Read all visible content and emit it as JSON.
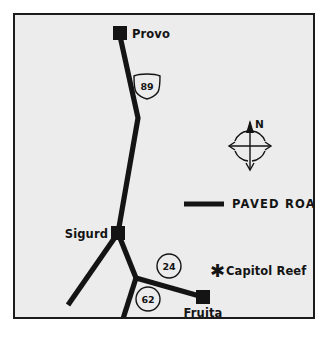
{
  "map": {
    "title": "Capitol Reef Area Road Map",
    "background_color": "#ececec",
    "frame_color": "#1b1b1b",
    "ink_color": "#141414",
    "cities": [
      {
        "name": "Provo",
        "marker": "filled-square",
        "x": 120,
        "y": 33,
        "label_x": 132,
        "label_y": 38
      },
      {
        "name": "Sigurd",
        "marker": "filled-square",
        "x": 118,
        "y": 233,
        "label_x": 111,
        "label_y": 238,
        "label_anchor": "end"
      },
      {
        "name": "Fruita",
        "marker": "filled-square",
        "x": 203,
        "y": 297,
        "label_x": 203,
        "label_y": 316,
        "label_anchor": "middle"
      }
    ],
    "parks": [
      {
        "name": "Capitol Reef",
        "marker": "star",
        "x": 216,
        "y": 270,
        "label_x": 226,
        "label_y": 275
      }
    ],
    "routes": [
      {
        "number": "89",
        "shield": "us-highway",
        "x": 147,
        "y": 86
      },
      {
        "number": "24",
        "shield": "state-circle",
        "x": 169,
        "y": 269
      },
      {
        "number": "62",
        "shield": "state-circle",
        "x": 148,
        "y": 301
      }
    ],
    "legend": {
      "label": "PAVED ROAD",
      "swatch": "thick-black-line",
      "swatch_x1": 184,
      "swatch_x2": 224,
      "swatch_y": 204,
      "label_x": 232,
      "label_y": 208
    },
    "compass": {
      "label": "N",
      "center_x": 250,
      "center_y": 145,
      "radius": 16
    },
    "road_paths": [
      {
        "id": "us89-north",
        "points": "120,36 138,118 118,233"
      },
      {
        "id": "sigurd-sw",
        "points": "118,233 68,305"
      },
      {
        "id": "sigurd-se",
        "points": "118,233 136,278"
      },
      {
        "id": "ut24-east",
        "points": "136,278 203,297"
      },
      {
        "id": "ut62-south",
        "points": "136,278 122,321"
      }
    ]
  }
}
